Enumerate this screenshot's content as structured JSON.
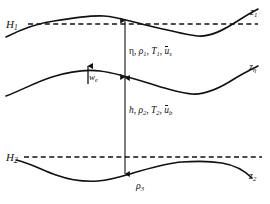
{
  "figure": {
    "background_color": "#ffffff",
    "stroke_color": "#111111",
    "width": 270,
    "height": 204
  },
  "labels": {
    "upper_mean_level": "H",
    "upper_mean_level_sub": "1",
    "lower_mean_level": "H",
    "lower_mean_level_sub": "2",
    "top_surface": "z",
    "top_surface_sub": "1",
    "interface_surface": "z",
    "interface_surface_sub": "η",
    "bottom_surface": "z",
    "bottom_surface_sub": "2",
    "entrainment_velocity": "w",
    "entrainment_velocity_sub": "e",
    "substrate_density": "ρ",
    "substrate_density_sub": "3"
  },
  "annotations": {
    "upper_layer": {
      "thickness": "η",
      "density": "ρ",
      "density_sub": "1",
      "temperature": "T",
      "temperature_sub": "1",
      "velocity": "u",
      "velocity_sub": "s",
      "separator": ", ",
      "full_text": "η, ρ₁, T₁, ūₛ"
    },
    "lower_layer": {
      "thickness": "h",
      "density": "ρ",
      "density_sub": "2",
      "temperature": "T",
      "temperature_sub": "2",
      "velocity": "u",
      "velocity_sub": "b",
      "separator": ", ",
      "full_text": "h, ρ₂, T₂, ūᵇ"
    }
  },
  "geometry": {
    "dashed_line_upper_y": 24,
    "dashed_line_lower_y": 157,
    "measure_line_x": 125,
    "entrainment_arrow_x": 88,
    "curves": {
      "top": "M 6 37 C 24 28 38 23 54 21 C 72 18 90 15 104 16 C 118 17 132 22 150 26 C 168 30 186 35 198 36 C 210 37 222 31 236 22 C 244 17 250 13 258 9",
      "middle": "M 6 96 C 22 90 36 82 52 77 C 68 72 84 69 100 71 C 116 73 132 78 148 83 C 164 88 178 93 192 94 C 206 95 220 88 234 79 C 242 74 250 70 258 66",
      "bottom": "M 16 160 C 30 163 42 170 56 175 C 70 180 84 182 98 181 C 112 180 126 175 140 171 C 154 167 168 163 182 162 C 196 161 210 161 222 163 C 234 165 244 170 252 178"
    }
  },
  "legend_note": {
    "upper_measure": "η spans from z₁ down to zη",
    "lower_measure": "h spans from zη down to z₂"
  }
}
